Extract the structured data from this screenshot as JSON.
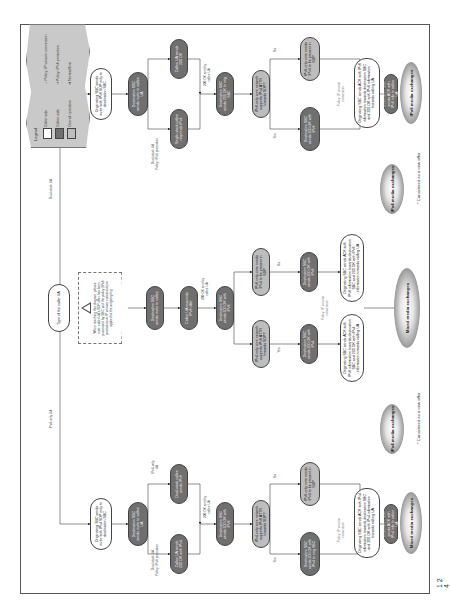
{
  "page": {
    "number": "1 2 4"
  },
  "legend": {
    "title": "Legend",
    "items": [
      {
        "swatch": "white",
        "label": "Caller side"
      },
      {
        "swatch": "dark",
        "label": "Callee side"
      },
      {
        "swatch": "mid",
        "label": "Overall operation"
      }
    ],
    "arrows": [
      {
        "style": "grey",
        "label": "Policy: IP version conversion"
      },
      {
        "style": "grey-dashed",
        "label": "Policy: IPv6 promotion"
      },
      {
        "style": "black",
        "label": "Normal flow"
      }
    ]
  },
  "root": {
    "label": "Type of the caller UA"
  },
  "branch_labels": {
    "ipv4_only": "IPv4-only UA",
    "dual_stack": "Dual-stack UA",
    "ipv6_only": "IPv6-only UA"
  },
  "note": {
    "text": "When reaching this diagram, please note: caller UA's SDP offer has been processed by SBC and the policy (IPv6 promotion or IP version conversion) is applied to the outgoing leg"
  },
  "left_column": {
    "start": "Originating SBC sends invite with IPv4 SDP only to destination SBC",
    "callee": "Destination SBC sends invite to callee UA",
    "edge_dual": "Dual-stack UA\nPolicy: IPv6 promotion",
    "edge_ipv6": "IPv6-only\nUA",
    "nodes": [
      {
        "id": "l1",
        "type": "dark",
        "text": "Callee UA sends 200 OK with IPv4"
      },
      {
        "id": "l2",
        "type": "dark",
        "text": "Dual-stack callee sends IPv6"
      },
      {
        "id": "l3",
        "type": "dark",
        "text": "Destination SBC sends 200 OK with IPv6"
      },
      {
        "id": "l4",
        "type": "mid",
        "text": "IPv4-only core network supports IPv6 ATTR towards SDP?"
      },
      {
        "id": "l5",
        "type": "mid",
        "text": "IPv6-only core needs IPv4 to be present in SDP"
      },
      {
        "id": "l6",
        "type": "dark",
        "text": "Destination SBC sends 200 OK with IPv4 to orig SBC"
      },
      {
        "id": "l7",
        "type": "dark",
        "text": "Destination SBC sends 200 OK with IPv6 to orig SBC"
      },
      {
        "id": "l8",
        "type": "white",
        "text": "Originating SBC sends ACK with IPv4 information towards destination SBC and 200 OK with IPv4 information towards calling UA"
      },
      {
        "id": "l9",
        "type": "dark",
        "text": "Destination SBC sends ACK with IPv4 info to callee UA"
      }
    ],
    "edges": [
      "200 OK sent by callee UA",
      "200 OK sent by callee UA",
      "Yes",
      "No",
      "Policy: IP version conversion"
    ],
    "clouds": [
      "Mixed media exchanges",
      "IPv4 media exchanges"
    ]
  },
  "middle_column": {
    "start": "Originating SBC sends invite with IPv6 SDP to destination SBC",
    "edge_dual": "Dual-stack UA\nPolicy: IPv6 promotion",
    "nodes": [
      {
        "id": "m1",
        "type": "dark",
        "text": "Destination SBC sends invite to callee"
      },
      {
        "id": "m2",
        "type": "dark",
        "text": "Callee UA responds IPv6 offer"
      },
      {
        "id": "m3",
        "type": "dark",
        "text": "Destination SBC sends 200 OK with IPv6"
      },
      {
        "id": "m4",
        "type": "mid",
        "text": "IPv4-only core network supports IPv6 ATTR towards SDP?"
      },
      {
        "id": "m5",
        "type": "mid",
        "text": "IPv6-only core needs IPv4 to be present in SDP"
      },
      {
        "id": "m6",
        "type": "dark",
        "text": "Destination SBC sends 200 OK with IPv4"
      },
      {
        "id": "m7",
        "type": "dark",
        "text": "Destination SBC sends 200 OK with IPv6"
      },
      {
        "id": "m8",
        "type": "white",
        "text": "Originating SBC sends ACK with IPv6 information towards destination SBC and 200 OK with IPv4 information towards calling UA"
      },
      {
        "id": "m9",
        "type": "white",
        "text": "Originating SBC sends ACK with IPv6 information towards destination SBC and 200 OK with IPv6 information towards calling UA"
      }
    ],
    "edges": [
      "200 OK sent by callee UA",
      "Yes",
      "No",
      "Policy: IP version conversion"
    ],
    "cloud": "Mixed media exchanges"
  },
  "right_column": {
    "start": "Originating SBC sends invite with IPv6 SDP only to destination SBC",
    "edge_dual": "Dual-stack UA\nPolicy: IPv6 promotion",
    "nodes": [
      {
        "id": "r1",
        "type": "dark",
        "text": "Destination SBC sends invite to callee UA"
      },
      {
        "id": "r2",
        "type": "dark",
        "text": "Single-stack callee responds IPv4"
      },
      {
        "id": "r3",
        "type": "dark",
        "text": "Callee UA sends 200 OK"
      },
      {
        "id": "r4",
        "type": "dark",
        "text": "Destination SBC sends 200 OK to orig SBC"
      },
      {
        "id": "r5",
        "type": "mid",
        "text": "IPv6-only core network supports IPv4 ATTR towards SDP?"
      },
      {
        "id": "r6",
        "type": "mid",
        "text": "IPv6-only core needs IPv4 to be present in SDP"
      },
      {
        "id": "r7",
        "type": "dark",
        "text": "Destination SBC sends 200 OK with IPv6"
      },
      {
        "id": "r8",
        "type": "dark",
        "text": "Destination SBC sends 200 OK with IPv4"
      },
      {
        "id": "r9",
        "type": "white",
        "text": "Originating SBC sends ACK with IPv6 information towards destination SBC and 200 OK with IPv6 information towards calling UA"
      },
      {
        "id": "r10",
        "type": "white",
        "text": "Originating SBC sends ACK with IPv6 information towards destination SBC and 200 OK with IPv4 information towards calling UA"
      },
      {
        "id": "r11",
        "type": "dark",
        "text": "Destination SBC sends ACK with IPv6 info to callee UA"
      },
      {
        "id": "r12",
        "type": "dark",
        "text": "Destination SBC sends ACK with IPv4 info to callee UA"
      }
    ],
    "edges": [
      "200 OK sent by callee UA",
      "Yes",
      "No",
      "Policy: IP version conversion"
    ],
    "clouds": [
      "IPv6 media exchanges",
      "IPv4 media exchanges"
    ]
  },
  "footnotes": [
    "* Considered as a new offer",
    "* Considered as a new offer"
  ]
}
